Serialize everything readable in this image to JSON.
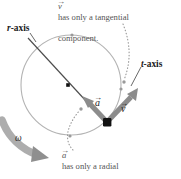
{
  "figure": {
    "name": "circular-motion-vectors-diagram",
    "background_color": "#ffffff"
  },
  "captions": {
    "top": "v⃗ has only a tangential\ncomponent.",
    "top_symbol": "v",
    "top_text_line1": "has only a tangential",
    "top_text_line2": "component.",
    "bottom": "a⃗ has only a radial\ncomponent.",
    "bottom_symbol": "a",
    "bottom_text_line1": "has only a radial",
    "bottom_text_line2": "component."
  },
  "labels": {
    "r_axis_italic": "r",
    "r_axis_rest": "-axis",
    "t_axis_italic": "t",
    "t_axis_rest": "-axis",
    "vector_a": "a",
    "vector_v": "v",
    "omega": "ω"
  },
  "colors": {
    "circle": "#b3b3b3",
    "vector_gray": "#8c8c8c",
    "axis_line": "#4d4d4d",
    "particle": "#111111",
    "center_dot": "#111111",
    "caption_text": "#555555",
    "label_text": "#1a1a1a",
    "omega_arrow": "#9a9a9a",
    "dotted_leader": "#9a9a9a",
    "tick_dot": "#9a9a9a"
  },
  "geometry": {
    "circle_center_x": 71,
    "circle_center_y": 85,
    "circle_radius": 50,
    "particle_x": 107,
    "particle_y": 122,
    "center_dot_x": 68,
    "center_dot_y": 85,
    "r_axis_start_x": 28,
    "r_axis_start_y": 38,
    "vector_a_tip_x": 84,
    "vector_a_tip_y": 99,
    "vector_v_tip_x": 135,
    "vector_v_tip_y": 92
  },
  "tick_dots": [
    {
      "x": 72,
      "y": 35
    },
    {
      "x": 121,
      "y": 89
    },
    {
      "x": 70,
      "y": 136
    }
  ]
}
